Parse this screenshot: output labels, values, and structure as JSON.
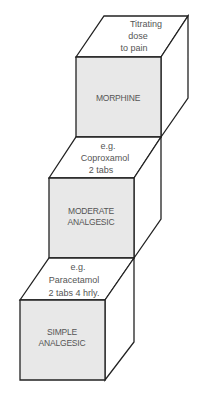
{
  "diagram": {
    "colors": {
      "line": "#222222",
      "front_face": "#e8e8e8",
      "top_face": "#ffffff",
      "side_face": "#ffffff",
      "text": "#555555"
    },
    "steps": [
      {
        "level": 3,
        "front_label_lines": [
          "MORPHINE"
        ],
        "top_label_lines": [
          "Titrating",
          "dose",
          "to pain"
        ]
      },
      {
        "level": 2,
        "front_label_lines": [
          "MODERATE",
          "ANALGESIC"
        ],
        "top_label_lines": [
          "e.g.",
          "Coproxamol",
          "2 tabs"
        ]
      },
      {
        "level": 1,
        "front_label_lines": [
          "SIMPLE",
          "ANALGESIC"
        ],
        "top_label_lines": [
          "e.g.",
          "Paracetamol",
          "2 tabs 4 hrly."
        ]
      }
    ]
  }
}
